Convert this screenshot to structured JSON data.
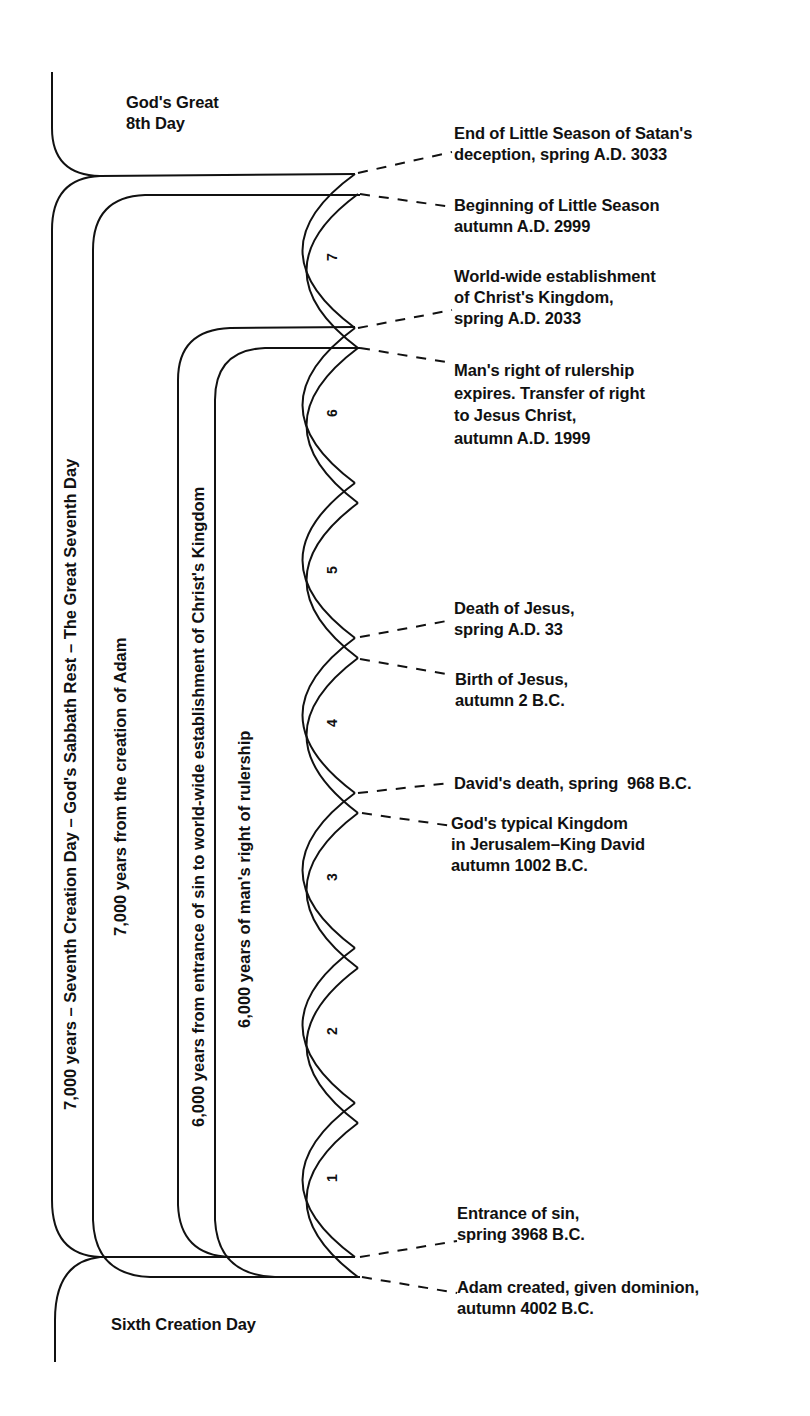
{
  "region_labels": {
    "top": "God's Great\n8th Day",
    "bottom": "Sixth Creation Day"
  },
  "brackets": [
    {
      "id": "seventh-day",
      "label": "7,000 years – Seventh Creation Day – God's Sabbath Rest – The Great Seventh Day"
    },
    {
      "id": "from-adam",
      "label": "7,000 years from the creation of Adam"
    },
    {
      "id": "sin-to-kingdom",
      "label": "6,000 years from entrance of sin to world-wide establishment of Christ's Kingdom"
    },
    {
      "id": "mans-rule",
      "label": "6,000 years of man's right of rulership"
    }
  ],
  "millennia": [
    "1",
    "2",
    "3",
    "4",
    "5",
    "6",
    "7"
  ],
  "events": [
    {
      "id": "end-little-season",
      "text": "End of Little Season of Satan's\ndeception, spring A.D. 3033"
    },
    {
      "id": "begin-little-season",
      "text": "Beginning of Little Season\nautumn A.D. 2999"
    },
    {
      "id": "kingdom-established",
      "text": "World-wide establishment\nof Christ's Kingdom,\nspring A.D. 2033"
    },
    {
      "id": "rulership-expires",
      "text": "Man's right of rulership\nexpires. Transfer of right\nto Jesus Christ,\nautumn A.D. 1999"
    },
    {
      "id": "death-of-jesus",
      "text": "Death of Jesus,\nspring A.D. 33"
    },
    {
      "id": "birth-of-jesus",
      "text": "Birth of Jesus,\nautumn 2 B.C."
    },
    {
      "id": "davids-death",
      "text": "David's death, spring  968 B.C."
    },
    {
      "id": "typical-kingdom",
      "text": "God's typical Kingdom\nin Jerusalem–King David\nautumn 1002 B.C."
    },
    {
      "id": "entrance-of-sin",
      "text": "Entrance of sin,\nspring 3968 B.C."
    },
    {
      "id": "adam-created",
      "text": "Adam created, given dominion,\nautumn 4002 B.C."
    }
  ],
  "colors": {
    "ink": "#111111",
    "background": "#ffffff"
  }
}
